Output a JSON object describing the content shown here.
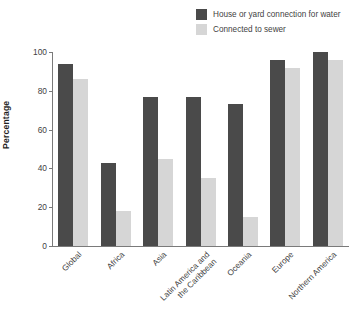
{
  "chart_data": {
    "type": "bar",
    "title": "",
    "xlabel": "",
    "ylabel": "Percentage",
    "ylim": [
      0,
      100
    ],
    "yticks": [
      0,
      20,
      40,
      60,
      80,
      100
    ],
    "grid": false,
    "legend_position": "top-right",
    "categories": [
      "Global",
      "Africa",
      "Asia",
      "Latin America and the Caribbean",
      "Oceania",
      "Europe",
      "Northern America"
    ],
    "category_lines": [
      [
        "Global"
      ],
      [
        "Africa"
      ],
      [
        "Asia"
      ],
      [
        "Latin America and",
        "the Caribbean"
      ],
      [
        "Oceania"
      ],
      [
        "Europe"
      ],
      [
        "Northern America"
      ]
    ],
    "series": [
      {
        "name": "House or yard connection for water",
        "color": "#4a4a4a",
        "values": [
          94,
          43,
          77,
          77,
          73,
          96,
          100
        ]
      },
      {
        "name": "Connected to sewer",
        "color": "#d6d6d6",
        "values": [
          86,
          18,
          45,
          35,
          15,
          92,
          96
        ]
      }
    ]
  },
  "axis": {
    "y_unit_suffix": ""
  }
}
